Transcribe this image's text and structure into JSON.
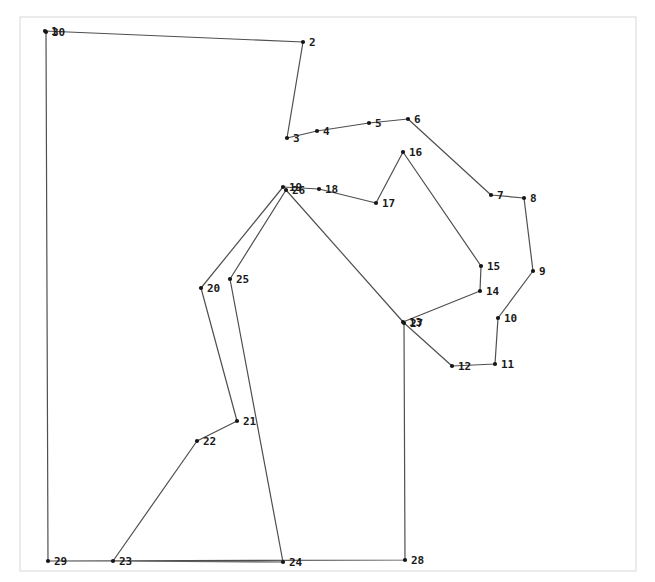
{
  "figure": {
    "width": 655,
    "height": 582,
    "background": "#ffffff",
    "frame": {
      "x": 20,
      "y": 17,
      "w": 616,
      "h": 554,
      "color": "#d8d8d8"
    },
    "line_color": "#4f4f4f",
    "line_width": 1.2,
    "marker_color": "#161616",
    "marker_radius": 2.1,
    "label_color": "#1a1a1a",
    "label_font_size": 11,
    "label_dx": 6,
    "label_dy": 4
  },
  "chart_data": {
    "type": "scatter",
    "title": "",
    "xlabel": "",
    "ylabel": "",
    "grid": false,
    "axes": "none",
    "nodes": [
      {
        "id": "1",
        "x": 45,
        "y": 31
      },
      {
        "id": "2",
        "x": 303,
        "y": 42
      },
      {
        "id": "3",
        "x": 287,
        "y": 138
      },
      {
        "id": "4",
        "x": 317,
        "y": 131
      },
      {
        "id": "5",
        "x": 369,
        "y": 123
      },
      {
        "id": "6",
        "x": 408,
        "y": 119
      },
      {
        "id": "7",
        "x": 491,
        "y": 195
      },
      {
        "id": "8",
        "x": 524,
        "y": 198
      },
      {
        "id": "9",
        "x": 533,
        "y": 271
      },
      {
        "id": "10",
        "x": 498,
        "y": 318
      },
      {
        "id": "11",
        "x": 495,
        "y": 364
      },
      {
        "id": "12",
        "x": 452,
        "y": 366
      },
      {
        "id": "13",
        "x": 403,
        "y": 322
      },
      {
        "id": "14",
        "x": 480,
        "y": 291
      },
      {
        "id": "15",
        "x": 481,
        "y": 266
      },
      {
        "id": "16",
        "x": 403,
        "y": 152
      },
      {
        "id": "17",
        "x": 376,
        "y": 203
      },
      {
        "id": "18",
        "x": 319,
        "y": 189
      },
      {
        "id": "19",
        "x": 283,
        "y": 187
      },
      {
        "id": "20",
        "x": 201,
        "y": 288
      },
      {
        "id": "21",
        "x": 237,
        "y": 421
      },
      {
        "id": "22",
        "x": 197,
        "y": 441
      },
      {
        "id": "23",
        "x": 113,
        "y": 561
      },
      {
        "id": "24",
        "x": 283,
        "y": 562
      },
      {
        "id": "25",
        "x": 230,
        "y": 279
      },
      {
        "id": "26",
        "x": 286,
        "y": 190
      },
      {
        "id": "27",
        "x": 404,
        "y": 323
      },
      {
        "id": "28",
        "x": 405,
        "y": 560
      },
      {
        "id": "29",
        "x": 48,
        "y": 561
      },
      {
        "id": "30",
        "x": 46,
        "y": 32
      }
    ],
    "tour_order": [
      "1",
      "2",
      "3",
      "4",
      "5",
      "6",
      "7",
      "8",
      "9",
      "10",
      "11",
      "12",
      "13",
      "14",
      "15",
      "16",
      "17",
      "18",
      "19",
      "20",
      "21",
      "22",
      "23",
      "24",
      "25",
      "26",
      "27",
      "28",
      "29",
      "30",
      "1"
    ]
  }
}
